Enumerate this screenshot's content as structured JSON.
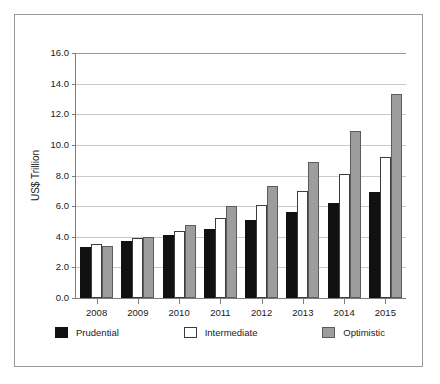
{
  "chart_data": {
    "type": "bar",
    "title": "",
    "xlabel": "",
    "ylabel": "US$ Trillion",
    "ylim": [
      0.0,
      16.0
    ],
    "ytick_labels": [
      "0.0",
      "2.0",
      "4.0",
      "6.0",
      "8.0",
      "10.0",
      "12.0",
      "14.0",
      "16.0"
    ],
    "ytick_values": [
      0.0,
      2.0,
      4.0,
      6.0,
      8.0,
      10.0,
      12.0,
      14.0,
      16.0
    ],
    "grid": true,
    "legend_position": "bottom",
    "categories": [
      "2008",
      "2009",
      "2010",
      "2011",
      "2012",
      "2013",
      "2014",
      "2015"
    ],
    "series": [
      {
        "name": "Prudential",
        "color": "#111111",
        "values": [
          3.3,
          3.7,
          4.1,
          4.5,
          5.1,
          5.6,
          6.2,
          6.9
        ]
      },
      {
        "name": "Intermediate",
        "color": "#ffffff",
        "values": [
          3.5,
          3.9,
          4.4,
          5.2,
          6.1,
          7.0,
          8.1,
          9.2
        ]
      },
      {
        "name": "Optimistic",
        "color": "#9d9d9d",
        "values": [
          3.4,
          4.0,
          4.8,
          6.0,
          7.3,
          8.9,
          10.9,
          13.3
        ]
      }
    ]
  }
}
